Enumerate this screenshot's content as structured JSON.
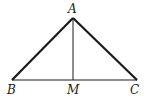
{
  "diagram": {
    "type": "triangle",
    "points": {
      "A": {
        "label": "A",
        "x": 73,
        "y": 18
      },
      "B": {
        "label": "B",
        "x": 12,
        "y": 80
      },
      "C": {
        "label": "C",
        "x": 137,
        "y": 80
      },
      "M": {
        "label": "M",
        "x": 73,
        "y": 80
      }
    },
    "segments": [
      {
        "from": "A",
        "to": "B",
        "style": "thick"
      },
      {
        "from": "A",
        "to": "C",
        "style": "thick"
      },
      {
        "from": "B",
        "to": "C",
        "style": "thin"
      },
      {
        "from": "A",
        "to": "M",
        "style": "thin"
      }
    ],
    "color": "#1a1a1a"
  }
}
